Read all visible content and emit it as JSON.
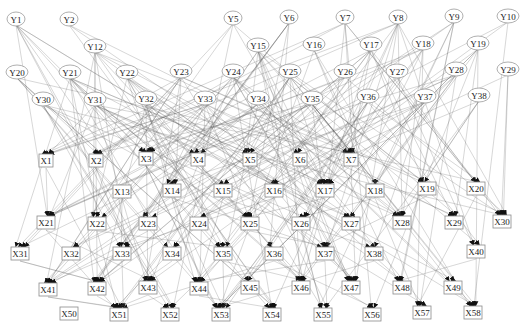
{
  "diagram": {
    "type": "directed-network",
    "y_nodes": [
      {
        "id": "Y1",
        "x": 16,
        "y": 19
      },
      {
        "id": "Y2",
        "x": 69,
        "y": 19
      },
      {
        "id": "Y5",
        "x": 233,
        "y": 18
      },
      {
        "id": "Y6",
        "x": 289,
        "y": 17
      },
      {
        "id": "Y7",
        "x": 345,
        "y": 17
      },
      {
        "id": "Y8",
        "x": 398,
        "y": 17
      },
      {
        "id": "Y9",
        "x": 454,
        "y": 16
      },
      {
        "id": "Y10",
        "x": 508,
        "y": 16
      },
      {
        "id": "Y12",
        "x": 95,
        "y": 46
      },
      {
        "id": "Y15",
        "x": 258,
        "y": 45
      },
      {
        "id": "Y16",
        "x": 314,
        "y": 44
      },
      {
        "id": "Y17",
        "x": 371,
        "y": 44
      },
      {
        "id": "Y18",
        "x": 423,
        "y": 43
      },
      {
        "id": "Y19",
        "x": 478,
        "y": 43
      },
      {
        "id": "Y20",
        "x": 17,
        "y": 72
      },
      {
        "id": "Y21",
        "x": 70,
        "y": 72
      },
      {
        "id": "Y22",
        "x": 127,
        "y": 72
      },
      {
        "id": "Y23",
        "x": 181,
        "y": 71
      },
      {
        "id": "Y24",
        "x": 233,
        "y": 71
      },
      {
        "id": "Y25",
        "x": 290,
        "y": 71
      },
      {
        "id": "Y26",
        "x": 345,
        "y": 71
      },
      {
        "id": "Y27",
        "x": 397,
        "y": 71
      },
      {
        "id": "Y28",
        "x": 456,
        "y": 69
      },
      {
        "id": "Y29",
        "x": 508,
        "y": 69
      },
      {
        "id": "Y30",
        "x": 43,
        "y": 99
      },
      {
        "id": "Y31",
        "x": 95,
        "y": 99
      },
      {
        "id": "Y32",
        "x": 146,
        "y": 98
      },
      {
        "id": "Y33",
        "x": 205,
        "y": 98
      },
      {
        "id": "Y34",
        "x": 258,
        "y": 98
      },
      {
        "id": "Y35",
        "x": 312,
        "y": 98
      },
      {
        "id": "Y36",
        "x": 368,
        "y": 96
      },
      {
        "id": "Y37",
        "x": 425,
        "y": 96
      },
      {
        "id": "Y38",
        "x": 479,
        "y": 95
      }
    ],
    "x_nodes": [
      {
        "id": "X1",
        "x": 46,
        "y": 161
      },
      {
        "id": "X2",
        "x": 96,
        "y": 161
      },
      {
        "id": "X3",
        "x": 146,
        "y": 159
      },
      {
        "id": "X4",
        "x": 198,
        "y": 160
      },
      {
        "id": "X5",
        "x": 250,
        "y": 160
      },
      {
        "id": "X6",
        "x": 300,
        "y": 160
      },
      {
        "id": "X7",
        "x": 351,
        "y": 160
      },
      {
        "id": "X13",
        "x": 122,
        "y": 192
      },
      {
        "id": "X14",
        "x": 172,
        "y": 191
      },
      {
        "id": "X15",
        "x": 223,
        "y": 191
      },
      {
        "id": "X16",
        "x": 274,
        "y": 191
      },
      {
        "id": "X17",
        "x": 325,
        "y": 191
      },
      {
        "id": "X18",
        "x": 375,
        "y": 191
      },
      {
        "id": "X19",
        "x": 427,
        "y": 189
      },
      {
        "id": "X20",
        "x": 476,
        "y": 189
      },
      {
        "id": "X21",
        "x": 46,
        "y": 223
      },
      {
        "id": "X22",
        "x": 97,
        "y": 224
      },
      {
        "id": "X23",
        "x": 148,
        "y": 224
      },
      {
        "id": "X24",
        "x": 199,
        "y": 224
      },
      {
        "id": "X25",
        "x": 250,
        "y": 224
      },
      {
        "id": "X26",
        "x": 301,
        "y": 224
      },
      {
        "id": "X27",
        "x": 351,
        "y": 224
      },
      {
        "id": "X28",
        "x": 402,
        "y": 223
      },
      {
        "id": "X29",
        "x": 454,
        "y": 223
      },
      {
        "id": "X30",
        "x": 502,
        "y": 222
      },
      {
        "id": "X31",
        "x": 20,
        "y": 254
      },
      {
        "id": "X32",
        "x": 71,
        "y": 254
      },
      {
        "id": "X33",
        "x": 122,
        "y": 254
      },
      {
        "id": "X34",
        "x": 172,
        "y": 254
      },
      {
        "id": "X35",
        "x": 223,
        "y": 254
      },
      {
        "id": "X36",
        "x": 274,
        "y": 254
      },
      {
        "id": "X37",
        "x": 325,
        "y": 254
      },
      {
        "id": "X38",
        "x": 374,
        "y": 254
      },
      {
        "id": "X40",
        "x": 476,
        "y": 252
      },
      {
        "id": "X41",
        "x": 48,
        "y": 290
      },
      {
        "id": "X42",
        "x": 97,
        "y": 289
      },
      {
        "id": "X43",
        "x": 148,
        "y": 288
      },
      {
        "id": "X44",
        "x": 199,
        "y": 289
      },
      {
        "id": "X45",
        "x": 250,
        "y": 288
      },
      {
        "id": "X46",
        "x": 301,
        "y": 288
      },
      {
        "id": "X47",
        "x": 351,
        "y": 288
      },
      {
        "id": "X48",
        "x": 402,
        "y": 288
      },
      {
        "id": "X49",
        "x": 453,
        "y": 288
      },
      {
        "id": "X50",
        "x": 69,
        "y": 314
      },
      {
        "id": "X51",
        "x": 119,
        "y": 315
      },
      {
        "id": "X52",
        "x": 170,
        "y": 315
      },
      {
        "id": "X53",
        "x": 221,
        "y": 315
      },
      {
        "id": "X54",
        "x": 272,
        "y": 315
      },
      {
        "id": "X55",
        "x": 323,
        "y": 315
      },
      {
        "id": "X56",
        "x": 372,
        "y": 315
      },
      {
        "id": "X57",
        "x": 422,
        "y": 313
      },
      {
        "id": "X58",
        "x": 473,
        "y": 313
      }
    ],
    "styles": {
      "background": "#ffffff",
      "edge_color": "#5a5a5a",
      "arrow_color": "#111111",
      "node_stroke": "#8a8a8a",
      "label_color": "#222222"
    }
  }
}
